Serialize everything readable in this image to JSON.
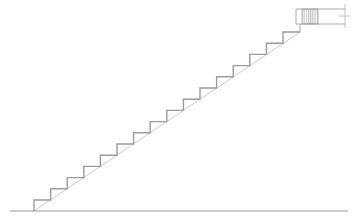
{
  "drawing": {
    "title": "Stair Section",
    "canvas": {
      "width": 359,
      "height": 223,
      "background": "#ffffff"
    },
    "colors": {
      "step_outline": "#9c9c9c",
      "soffit_line": "#b4b4b4",
      "ground_line": "#8f8f8f",
      "landing_outline": "#a0a0a0",
      "hatch": "#8a8a8a",
      "dimension": "#a8a8a8"
    },
    "linework": {
      "step_stroke_width": 1.4,
      "soffit_stroke_width": 0.7,
      "ground_stroke_width": 0.9,
      "landing_stroke_width": 0.9,
      "hatch_stroke_width": 0.6,
      "dimension_stroke_width": 0.7
    }
  },
  "chart_data": {
    "type": "line",
    "xlabel": "",
    "ylabel": "",
    "xlim": [
      0,
      359
    ],
    "ylim": [
      223,
      0
    ],
    "grid": false,
    "legend": "none",
    "stair": {
      "riser_count": 16,
      "tread_run_px": 16.6,
      "riser_height_px": 11.2,
      "start_x": 34,
      "start_y": 211,
      "top_x": 300,
      "top_y": 32
    },
    "series": [
      {
        "name": "step-profile",
        "points": [
          [
            34,
            211
          ],
          [
            34,
            200
          ],
          [
            50.6,
            200
          ],
          [
            50.6,
            188.8
          ],
          [
            67.2,
            188.8
          ],
          [
            67.2,
            177.6
          ],
          [
            83.8,
            177.6
          ],
          [
            83.8,
            166.4
          ],
          [
            100.4,
            166.4
          ],
          [
            100.4,
            155.2
          ],
          [
            117.0,
            155.2
          ],
          [
            117.0,
            144.0
          ],
          [
            133.6,
            144.0
          ],
          [
            133.6,
            132.8
          ],
          [
            150.2,
            132.8
          ],
          [
            150.2,
            121.6
          ],
          [
            166.8,
            121.6
          ],
          [
            166.8,
            110.4
          ],
          [
            183.4,
            110.4
          ],
          [
            183.4,
            99.2
          ],
          [
            200.0,
            99.2
          ],
          [
            200.0,
            88.0
          ],
          [
            216.6,
            88.0
          ],
          [
            216.6,
            76.8
          ],
          [
            233.2,
            76.8
          ],
          [
            233.2,
            65.6
          ],
          [
            249.8,
            65.6
          ],
          [
            249.8,
            54.4
          ],
          [
            266.4,
            54.4
          ],
          [
            266.4,
            43.2
          ],
          [
            283.0,
            43.2
          ],
          [
            283.0,
            32.0
          ],
          [
            300.0,
            32.0
          ]
        ]
      },
      {
        "name": "soffit-line",
        "points": [
          [
            34,
            211
          ],
          [
            300,
            32
          ]
        ]
      },
      {
        "name": "ground-line",
        "points": [
          [
            10,
            211
          ],
          [
            348,
            211
          ]
        ]
      },
      {
        "name": "landing-slab-top",
        "points": [
          [
            296,
            9
          ],
          [
            345,
            9
          ]
        ]
      },
      {
        "name": "landing-slab-bottom",
        "points": [
          [
            296,
            24
          ],
          [
            345,
            24
          ]
        ]
      },
      {
        "name": "landing-left-edge",
        "points": [
          [
            296,
            9
          ],
          [
            296,
            24
          ]
        ]
      },
      {
        "name": "landing-riser-face",
        "points": [
          [
            300,
            24
          ],
          [
            300,
            32
          ]
        ]
      },
      {
        "name": "dimension-tick",
        "points": [
          [
            345,
            4
          ],
          [
            345,
            28
          ]
        ]
      }
    ],
    "hatched_region": {
      "name": "beam-section-hatch",
      "x": 302,
      "y": 9,
      "width": 16,
      "height": 15,
      "pattern": "vertical-dense-hatch"
    }
  }
}
